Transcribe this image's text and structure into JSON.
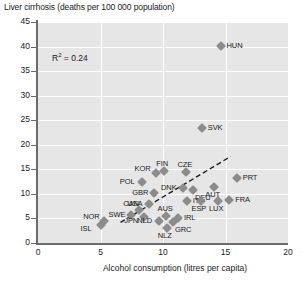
{
  "chart_data": {
    "type": "scatter",
    "title": "Liver cirrhosis (deaths per 100 000 population)",
    "xlabel": "Alcohol consumption (litres per capita)",
    "ylabel": "Liver cirrhosis (deaths per 100 000 population)",
    "xlim": [
      0,
      20
    ],
    "ylim": [
      0,
      45
    ],
    "xticks": [
      0,
      5,
      10,
      15,
      20
    ],
    "yticks": [
      0,
      5,
      10,
      15,
      20,
      25,
      30,
      35,
      40,
      45
    ],
    "grid": true,
    "legend": "none",
    "annotations": [
      {
        "text": "R² = 0.24",
        "symbol": "R",
        "sup": "2",
        "rest": " = 0.24",
        "x": 2.2,
        "y": 38.0
      }
    ],
    "trendline": {
      "style": "dashed",
      "color": "#1a1a1a",
      "x_start": 6.6,
      "y_start": 4.2,
      "x_end": 15.4,
      "y_end": 17.6
    },
    "marker": {
      "shape": "diamond",
      "color": "#8c8c8c",
      "size": 7
    },
    "points": [
      {
        "label": "ISL",
        "x": 5.0,
        "y": 3.7,
        "label_pos": "left-below"
      },
      {
        "label": "NOR",
        "x": 5.3,
        "y": 4.4,
        "label_pos": "left-above"
      },
      {
        "label": "SWE",
        "x": 7.4,
        "y": 5.6,
        "label_pos": "left"
      },
      {
        "label": "CAN",
        "x": 8.1,
        "y": 6.8,
        "label_pos": "above-left"
      },
      {
        "label": "JPN",
        "x": 8.5,
        "y": 5.3,
        "label_pos": "left-below"
      },
      {
        "label": "USA",
        "x": 8.9,
        "y": 8.0,
        "label_pos": "left"
      },
      {
        "label": "NLD",
        "x": 9.7,
        "y": 4.4,
        "label_pos": "left"
      },
      {
        "label": "AUS",
        "x": 10.2,
        "y": 5.5,
        "label_pos": "above"
      },
      {
        "label": "NLZ",
        "x": 10.3,
        "y": 3.1,
        "label_pos": "below"
      },
      {
        "label": "GRC",
        "x": 10.8,
        "y": 4.3,
        "label_pos": "below-right"
      },
      {
        "label": "IRL",
        "x": 11.2,
        "y": 5.0,
        "label_pos": "right"
      },
      {
        "label": "POL",
        "x": 8.3,
        "y": 12.5,
        "label_pos": "left"
      },
      {
        "label": "GBR",
        "x": 9.3,
        "y": 10.2,
        "label_pos": "left"
      },
      {
        "label": "KOR",
        "x": 9.4,
        "y": 14.2,
        "label_pos": "left-above"
      },
      {
        "label": "FIN",
        "x": 10.1,
        "y": 14.6,
        "label_pos": "above"
      },
      {
        "label": "CZE",
        "x": 11.8,
        "y": 14.4,
        "label_pos": "above"
      },
      {
        "label": "DNK",
        "x": 11.6,
        "y": 11.2,
        "label_pos": "left"
      },
      {
        "label": "DEU",
        "x": 12.4,
        "y": 10.8,
        "label_pos": "below-right"
      },
      {
        "label": "ITA",
        "x": 11.9,
        "y": 8.6,
        "label_pos": "right"
      },
      {
        "label": "ESP",
        "x": 13.0,
        "y": 8.6,
        "label_pos": "below"
      },
      {
        "label": "LUX",
        "x": 14.4,
        "y": 8.6,
        "label_pos": "below"
      },
      {
        "label": "AUT",
        "x": 14.1,
        "y": 11.5,
        "label_pos": "below"
      },
      {
        "label": "FRA",
        "x": 15.3,
        "y": 8.7,
        "label_pos": "right"
      },
      {
        "label": "PRT",
        "x": 15.9,
        "y": 13.2,
        "label_pos": "right"
      },
      {
        "label": "SVK",
        "x": 13.1,
        "y": 23.5,
        "label_pos": "right"
      },
      {
        "label": "HUN",
        "x": 14.6,
        "y": 40.2,
        "label_pos": "right"
      }
    ]
  }
}
